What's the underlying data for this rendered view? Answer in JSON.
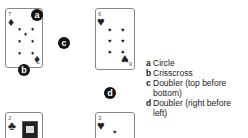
{
  "cards": [
    {
      "rank": "7",
      "suit": "diamond",
      "suit_glyph": "♦",
      "rank_bottom": "L"
    },
    {
      "rank": "6",
      "suit": "heart",
      "suit_glyph": "♥",
      "rank_bottom": "9"
    },
    {
      "rank": "J",
      "suit": "club",
      "suit_glyph": "♣"
    },
    {
      "rank": "3",
      "suit": "heart",
      "suit_glyph": "♥"
    }
  ],
  "badges": {
    "a": "a",
    "b": "b",
    "c": "c",
    "d": "d"
  },
  "legend": [
    {
      "key": "a",
      "text": "Circle"
    },
    {
      "key": "b",
      "text": "Crisscross"
    },
    {
      "key": "c",
      "text": "Doubler (top before bottom)"
    },
    {
      "key": "d",
      "text": "Doubler (right before left)"
    }
  ]
}
